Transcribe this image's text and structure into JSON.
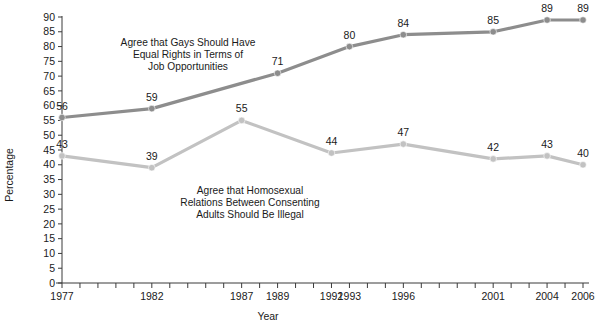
{
  "chart_data": {
    "type": "line",
    "title": "",
    "xlabel": "Year",
    "ylabel": "Percentage",
    "ylim": [
      0,
      90
    ],
    "ytick_step": 5,
    "yticks": [
      0,
      5,
      10,
      15,
      20,
      25,
      30,
      35,
      40,
      45,
      50,
      55,
      60,
      65,
      70,
      75,
      80,
      85,
      90
    ],
    "xlim": [
      1977,
      2006
    ],
    "xtick_years": [
      1977,
      1978,
      1979,
      1980,
      1981,
      1982,
      1983,
      1984,
      1985,
      1986,
      1987,
      1988,
      1989,
      1990,
      1991,
      1992,
      1993,
      1994,
      1995,
      1996,
      1997,
      1998,
      1999,
      2000,
      2001,
      2002,
      2003,
      2004,
      2005,
      2006
    ],
    "xtick_labels": [
      "1977",
      "1982",
      "1987",
      "1989",
      "1992",
      "1993",
      "1996",
      "2001",
      "2004",
      "2006"
    ],
    "xtick_label_years": [
      1977,
      1982,
      1987,
      1989,
      1992,
      1993,
      1996,
      2001,
      2004,
      2006
    ],
    "grid": false,
    "legend_position": "inline-annotation",
    "series": [
      {
        "name": "Agree that Gays Should Have Equal Rights in Terms of Job Opportunities",
        "color": "#8d8d8d",
        "x": [
          1977,
          1982,
          1989,
          1993,
          1996,
          2001,
          2004,
          2006
        ],
        "values": [
          56,
          59,
          71,
          80,
          84,
          85,
          89,
          89
        ],
        "labels": [
          "56",
          "59",
          "71",
          "80",
          "84",
          "85",
          "89",
          "89"
        ]
      },
      {
        "name": "Agree that Homosexual Relations Between Consenting Adults Should Be Illegal",
        "color": "#c2c2c2",
        "x": [
          1977,
          1982,
          1987,
          1992,
          1996,
          2001,
          2004,
          2006
        ],
        "values": [
          43,
          39,
          55,
          44,
          47,
          42,
          43,
          40
        ],
        "labels": [
          "43",
          "39",
          "55",
          "44",
          "47",
          "42",
          "43",
          "40"
        ]
      }
    ],
    "annotations": [
      {
        "id": "annotation-upper",
        "lines": [
          "Agree that Gays Should Have",
          "Equal Rights in Terms of",
          "Job Opportunities"
        ],
        "series": "Agree that Gays Should Have Equal Rights in Terms of Job Opportunities"
      },
      {
        "id": "annotation-lower",
        "lines": [
          "Agree that Homosexual",
          "Relations Between Consenting",
          "Adults Should Be Illegal"
        ],
        "series": "Agree that Homosexual Relations Between Consenting Adults Should Be Illegal"
      }
    ]
  },
  "axis": {
    "y_title": "Percentage",
    "x_title": "Year"
  },
  "colors": {
    "axis": "#3b3b3b",
    "series_upper": "#8d8d8d",
    "series_lower": "#c2c2c2",
    "text": "#1a1a1a",
    "background": "#ffffff"
  }
}
